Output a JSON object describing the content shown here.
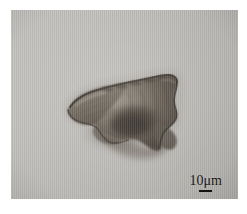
{
  "figure": {
    "type": "light-micrograph",
    "panel": {
      "background_color": "#bcbab6",
      "border_color": "#ffffff"
    },
    "specimen": {
      "description": "irregular dark brown-grey organic particle (palynomorph / cyst) with ragged folded margin and diffuse shadow",
      "fill_color": "#4a4139",
      "edge_color": "#2a241e",
      "highlight_color": "#8d8478"
    },
    "scale_bar": {
      "label": "10μm",
      "value": 10,
      "unit": "μm",
      "bar_color": "#151311",
      "position": "bottom-right"
    },
    "caption": {
      "text": "",
      "note": "faint clipped text line at bottom edge, illegible"
    }
  }
}
